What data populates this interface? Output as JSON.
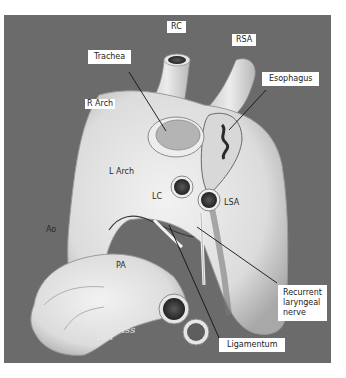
{
  "figure": {
    "background_color": "#6b6b6b",
    "tissue_color": "#e4e4e4",
    "boxed_labels": {
      "rc": "RC",
      "rsa": "RSA",
      "trachea": "Trachea",
      "esophagus": "Esophagus",
      "recurrent_laryngeal_nerve": "Recurrent\nlaryngeal\nnerve",
      "ligamentum": "Ligamentum"
    },
    "inline_labels": {
      "r_arch": "R Arch",
      "l_arch": "L Arch",
      "lc": "LC",
      "lsa": "LSA",
      "ao": "Ao",
      "pa": "PA"
    },
    "signature": {
      "name": "R.Idriss",
      "year": "2001"
    }
  }
}
